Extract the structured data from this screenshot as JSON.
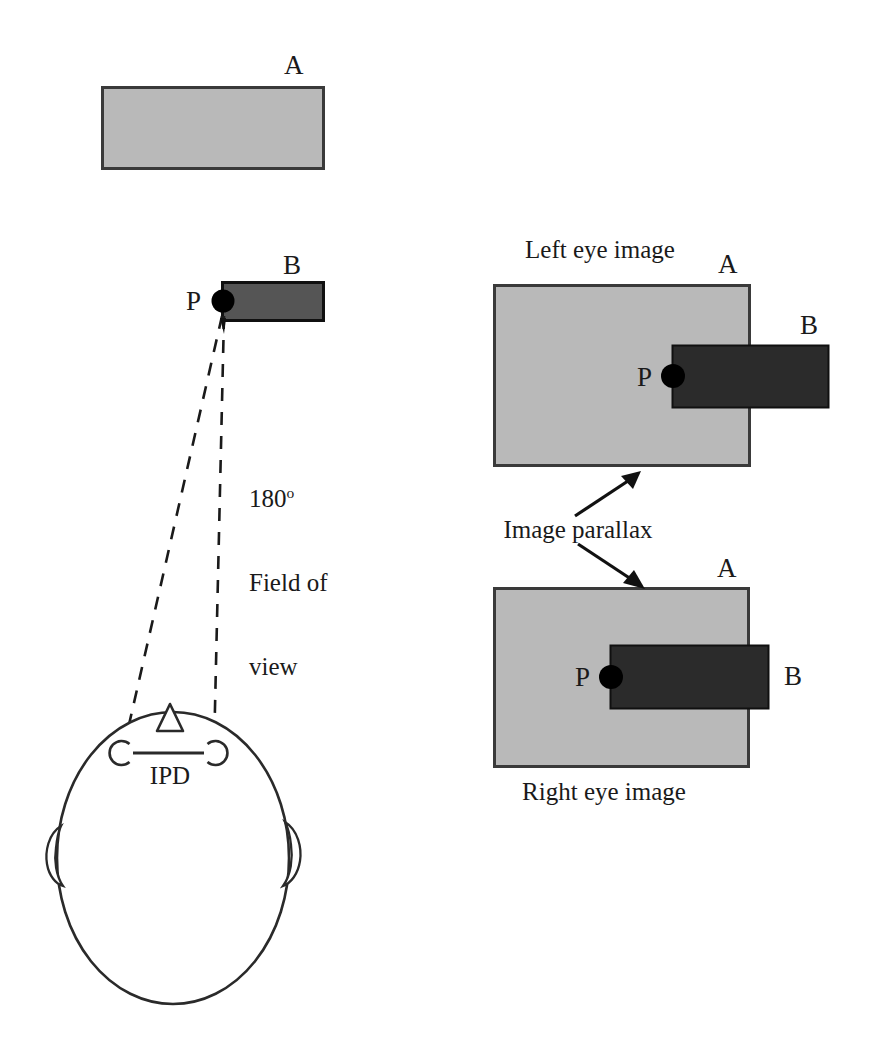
{
  "figure": {
    "type": "diagram"
  },
  "colors": {
    "object_a_fill": "#b9b9b9",
    "object_a_stroke": "#3a3a3a",
    "object_b_fill_scene": "#555555",
    "object_b_fill_eye": "#2b2b2b",
    "object_b_stroke": "#101010",
    "point_marker": "#000000",
    "line": "#1a1a1a",
    "background": "#ffffff"
  },
  "scene": {
    "object_a_label": "A",
    "object_b_label": "B",
    "point_label": "P",
    "fov_value": "180",
    "fov_degree_symbol": "o",
    "fov_line1": "Field of",
    "fov_line2": "view",
    "ipd_label": "IPD"
  },
  "eye_views": {
    "left": {
      "caption": "Left eye image",
      "object_a_label": "A",
      "object_b_label": "B",
      "point_label": "P"
    },
    "right": {
      "caption": "Right eye image",
      "object_a_label": "A",
      "object_b_label": "B",
      "point_label": "P"
    },
    "parallax_label": "Image parallax"
  }
}
